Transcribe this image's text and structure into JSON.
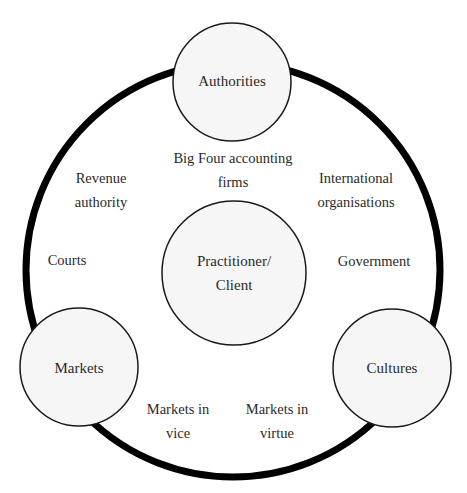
{
  "diagram": {
    "type": "concentric-network",
    "outer_ring": {
      "cx": 233,
      "cy": 270,
      "r": 207,
      "stroke_width": 7,
      "color": "#000000"
    },
    "nodes": [
      {
        "id": "authorities",
        "label": "Authorities",
        "cx": 232,
        "cy": 82,
        "r": 59
      },
      {
        "id": "markets",
        "label": "Markets",
        "cx": 79,
        "cy": 367,
        "r": 59
      },
      {
        "id": "cultures",
        "label": "Cultures",
        "cx": 392,
        "cy": 368,
        "r": 59
      },
      {
        "id": "practitioner-client",
        "label_line1": "Practitioner/",
        "label_line2": "Client",
        "cx": 234,
        "cy": 273,
        "r": 72
      }
    ],
    "node_fill": "#f6f6f6",
    "node_stroke": "#1a1a1a",
    "labels": {
      "big_four_line1": "Big Four accounting",
      "big_four_line2": "firms",
      "revenue_line1": "Revenue",
      "revenue_line2": "authority",
      "international_line1": "International",
      "international_line2": "organisations",
      "courts": "Courts",
      "government": "Government",
      "markets_vice_line1": "Markets in",
      "markets_vice_line2": "vice",
      "markets_virtue_line1": "Markets in",
      "markets_virtue_line2": "virtue"
    }
  }
}
